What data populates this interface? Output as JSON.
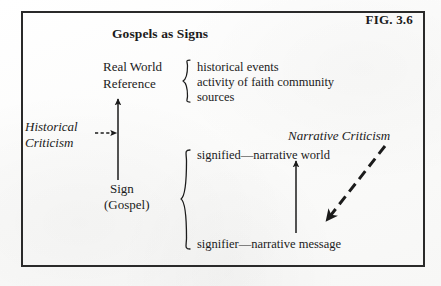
{
  "figure": {
    "label": "FIG. 3.6",
    "title": "Gospels as Signs",
    "border_color": "#2a2a2a",
    "ink_color": "#1b1b1b",
    "background_color": "#fdfdfd"
  },
  "nodes": {
    "real_world_reference": {
      "line1": "Real World",
      "line2": "Reference"
    },
    "sign": {
      "line1": "Sign",
      "line2": "(Gospel)"
    },
    "signified": "signified—narrative world",
    "signifier": "signifier—narrative message"
  },
  "reference_items": [
    "historical events",
    "activity of faith community",
    "sources"
  ],
  "method_labels": {
    "historical_criticism": {
      "line1": "Historical",
      "line2": "Criticism"
    },
    "narrative_criticism": "Narrative Criticism"
  },
  "connectors": {
    "sign_to_real_world": "solid-up-arrow",
    "signifier_to_signified": "solid-up-arrow",
    "historical_criticism_pointer": "dashed-right-arrow",
    "narrative_criticism_pointer": "dashed-diagonal-arrow",
    "reference_brace": "curly-brace-left",
    "sign_brace": "curly-brace-left"
  }
}
